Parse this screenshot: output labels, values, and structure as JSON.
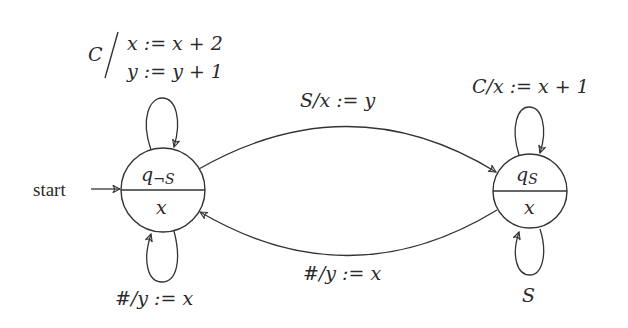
{
  "diagram": {
    "type": "finite-state-machine",
    "colors": {
      "stroke": "#333333",
      "text": "#2a2a2a",
      "background": "#ffffff"
    },
    "start_label": "start",
    "states": [
      {
        "id": "q_not_s",
        "name": "q¬S",
        "name_base": "q",
        "name_sub": "¬S",
        "output": "x",
        "initial": true
      },
      {
        "id": "q_s",
        "name": "qS",
        "name_base": "q",
        "name_sub": "S",
        "output": "x",
        "initial": false
      }
    ],
    "transitions": [
      {
        "from": "q_not_s",
        "to": "q_not_s",
        "position": "above",
        "input": "C",
        "actions": [
          "x := x + 2",
          "y := y + 1"
        ]
      },
      {
        "from": "q_not_s",
        "to": "q_not_s",
        "position": "below",
        "label": "#/y := x"
      },
      {
        "from": "q_not_s",
        "to": "q_s",
        "position": "top-arc",
        "label": "S/x := y"
      },
      {
        "from": "q_s",
        "to": "q_not_s",
        "position": "bottom-arc",
        "label": "#/y := x"
      },
      {
        "from": "q_s",
        "to": "q_s",
        "position": "above",
        "label": "C/x := x + 1"
      },
      {
        "from": "q_s",
        "to": "q_s",
        "position": "below",
        "label": "S"
      }
    ]
  }
}
